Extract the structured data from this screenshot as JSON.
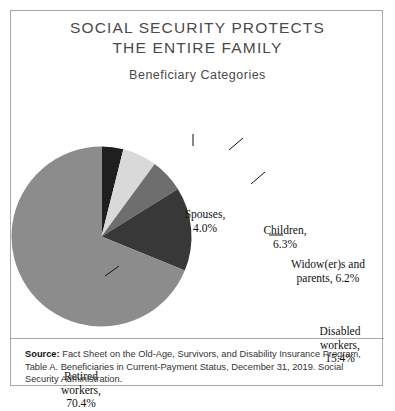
{
  "frame": {
    "border_color": "#a8a8a8"
  },
  "header": {
    "title_line1": "SOCIAL SECURITY PROTECTS",
    "title_line2": "THE ENTIRE FAMILY",
    "subtitle": "Beneficiary Categories"
  },
  "footer": {
    "source_label": "Source:",
    "source_text": " Fact Sheet on the Old-Age, Survivors, and Disability Insurance Program, Table A. Beneficiaries in Current-Payment Status, December 31, 2019. Social Security Administration."
  },
  "labels": {
    "spouses": "Spouses,\n4.0%",
    "spouses_l1": "Spouses,",
    "spouses_l2": "4.0%",
    "children_l1": "Children,",
    "children_l2": "6.3%",
    "widowers_l1": "Widow(er)s and",
    "widowers_l2": "parents, 6.2%",
    "disabled_l1": "Disabled",
    "disabled_l2": "workers,",
    "disabled_l3": "15.4%",
    "retired_l1": "Retired",
    "retired_l2": "workers,",
    "retired_l3": "70.4%"
  },
  "chart_data": {
    "type": "pie",
    "title": "SOCIAL SECURITY PROTECTS THE ENTIRE FAMILY",
    "subtitle": "Beneficiary Categories",
    "start_angle_deg": 0,
    "direction": "clockwise",
    "units": "percent",
    "total": 102.3,
    "categories": [
      "Spouses",
      "Children",
      "Widow(er)s and parents",
      "Disabled workers",
      "Retired workers"
    ],
    "values": [
      4.0,
      6.3,
      6.2,
      15.4,
      70.4
    ],
    "colors": [
      "#1f1f1f",
      "#d9d9d9",
      "#6e6e6e",
      "#383838",
      "#8c8c8c"
    ],
    "slices": [
      {
        "label": "Spouses",
        "value": 4.0,
        "color": "#1f1f1f"
      },
      {
        "label": "Children",
        "value": 6.3,
        "color": "#d9d9d9"
      },
      {
        "label": "Widow(er)s and parents",
        "value": 6.2,
        "color": "#6e6e6e"
      },
      {
        "label": "Disabled workers",
        "value": 15.4,
        "color": "#383838"
      },
      {
        "label": "Retired workers",
        "value": 70.4,
        "color": "#8c8c8c"
      }
    ],
    "legend": "none",
    "data_labels": "callouts with leader lines",
    "grid": false
  }
}
